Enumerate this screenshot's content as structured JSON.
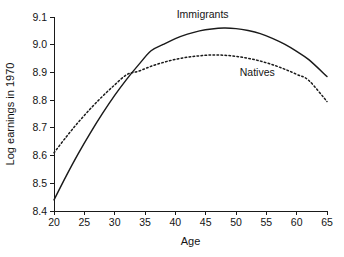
{
  "chart_data": {
    "type": "line",
    "title": "",
    "xlabel": "Age",
    "ylabel": "Log earnings in 1970",
    "xlim": [
      20,
      65
    ],
    "ylim": [
      8.4,
      9.1
    ],
    "xticks": [
      20,
      25,
      30,
      35,
      40,
      45,
      50,
      55,
      60,
      65
    ],
    "yticks": [
      8.4,
      8.5,
      8.6,
      8.7,
      8.8,
      8.9,
      9.0,
      9.1
    ],
    "xtick_labels": [
      "20",
      "25",
      "30",
      "35",
      "40",
      "45",
      "50",
      "55",
      "60",
      "65"
    ],
    "ytick_labels": [
      "8.4",
      "8.5",
      "8.6",
      "8.7",
      "8.8",
      "8.9",
      "9.0",
      "9.1"
    ],
    "grid": false,
    "legend_position": "inline-annotation",
    "x": [
      20,
      22,
      24,
      26,
      28,
      30,
      32,
      34,
      36,
      38,
      40,
      42,
      44,
      46,
      48,
      50,
      52,
      54,
      56,
      58,
      60,
      62,
      65
    ],
    "series": [
      {
        "name": "Immigrants",
        "style": "solid",
        "color": "#1a1a1a",
        "annotation": {
          "text": "Immigrants",
          "x": 44.5,
          "y": 9.095
        },
        "peak": {
          "x": 49,
          "y": 9.06
        },
        "values": [
          8.44,
          8.526,
          8.607,
          8.682,
          8.752,
          8.817,
          8.876,
          8.929,
          8.978,
          9.001,
          9.022,
          9.038,
          9.05,
          9.057,
          9.06,
          9.058,
          9.051,
          9.04,
          9.023,
          9.002,
          8.976,
          8.946,
          8.885
        ]
      },
      {
        "name": "Natives",
        "style": "dotted",
        "color": "#1a1a1a",
        "annotation": {
          "text": "Natives",
          "x": 53.5,
          "y": 8.888
        },
        "peak": {
          "x": 46,
          "y": 8.963
        },
        "values": [
          8.61,
          8.667,
          8.72,
          8.769,
          8.814,
          8.855,
          8.892,
          8.905,
          8.922,
          8.936,
          8.947,
          8.955,
          8.96,
          8.963,
          8.962,
          8.958,
          8.951,
          8.941,
          8.928,
          8.912,
          8.893,
          8.871,
          8.795
        ]
      }
    ]
  },
  "axes": {
    "x_title": "Age",
    "y_title": "Log earnings in 1970"
  }
}
